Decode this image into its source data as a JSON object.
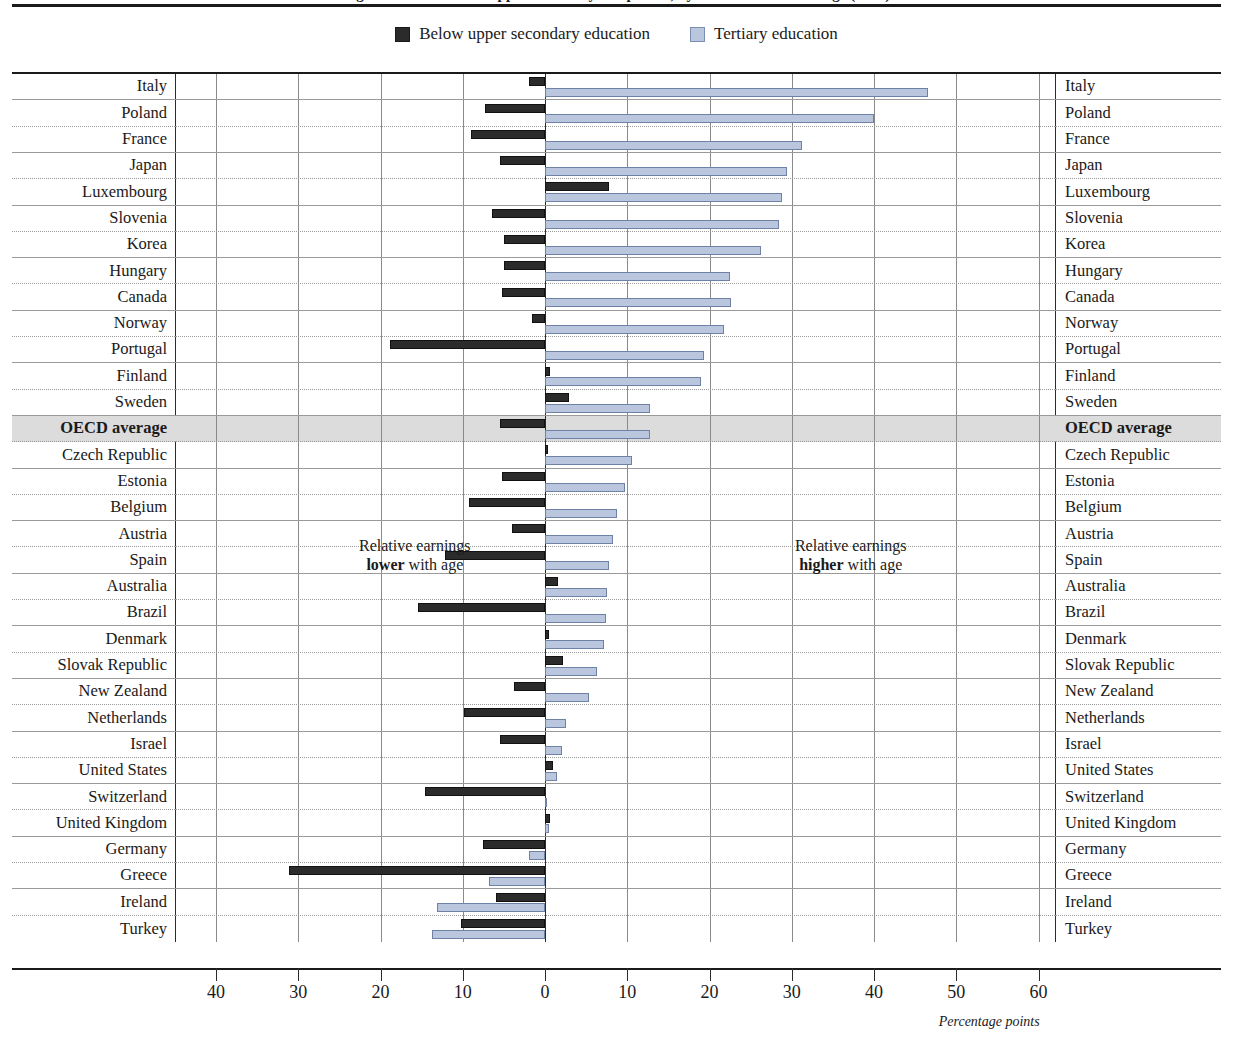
{
  "title": "Figure A6.2. Trends in upper secondary completion, by education level and age (2012)",
  "legend": [
    {
      "label": "Below upper secondary education",
      "swatch": "dark-square-icon",
      "color": "#2b2b2b"
    },
    {
      "label": "Tertiary education",
      "swatch": "blue-square-icon",
      "color": "#b9c6de"
    }
  ],
  "annotations": {
    "left_line1": "Relative earnings",
    "left_bold": "lower",
    "left_rest": " with age",
    "right_line1": "Relative earnings",
    "right_bold": "higher",
    "right_rest": " with age"
  },
  "axis": {
    "unit_label": "Percentage points",
    "tick_labels": [
      "40",
      "30",
      "20",
      "10",
      "0",
      "10",
      "20",
      "30",
      "40",
      "50",
      "60"
    ],
    "tick_values": [
      -40,
      -30,
      -20,
      -10,
      0,
      10,
      20,
      30,
      40,
      50,
      60
    ]
  },
  "chart_data": {
    "type": "bar",
    "orientation": "horizontal",
    "title": "Figure A6.2. Trends in upper secondary completion, by education level and age (2012)",
    "xlabel": "Percentage points",
    "ylabel": "",
    "xlim": [
      -45,
      62
    ],
    "grid": true,
    "legend_position": "top-center",
    "categories": [
      "Italy",
      "Poland",
      "France",
      "Japan",
      "Luxembourg",
      "Slovenia",
      "Korea",
      "Hungary",
      "Canada",
      "Norway",
      "Portugal",
      "Finland",
      "Sweden",
      "OECD average",
      "Czech Republic",
      "Estonia",
      "Belgium",
      "Austria",
      "Spain",
      "Australia",
      "Brazil",
      "Denmark",
      "Slovak Republic",
      "New Zealand",
      "Netherlands",
      "Israel",
      "United States",
      "Switzerland",
      "United Kingdom",
      "Germany",
      "Greece",
      "Ireland",
      "Turkey"
    ],
    "highlight_category": "OECD average",
    "series": [
      {
        "name": "Below upper secondary education",
        "color": "#2b2b2b",
        "values": [
          -2.0,
          -7.3,
          -9.0,
          -5.5,
          7.8,
          -6.4,
          -5.0,
          -5.0,
          -5.3,
          -1.6,
          -18.8,
          0.6,
          2.9,
          -5.5,
          0.3,
          -5.3,
          -9.2,
          -4.0,
          -12.2,
          1.6,
          -15.4,
          0.5,
          2.2,
          -3.8,
          -9.9,
          -5.5,
          1.0,
          -14.6,
          0.6,
          -7.5,
          -31.1,
          -6.0,
          -10.2
        ]
      },
      {
        "name": "Tertiary education",
        "color": "#b9c6de",
        "values": [
          46.6,
          40.0,
          31.2,
          29.4,
          28.8,
          28.5,
          26.2,
          22.5,
          22.6,
          21.7,
          19.3,
          19.0,
          12.8,
          12.7,
          10.6,
          9.7,
          8.8,
          8.3,
          7.8,
          7.5,
          7.4,
          7.2,
          6.3,
          5.4,
          2.5,
          2.1,
          1.4,
          0.2,
          0.5,
          -1.9,
          -6.8,
          -13.2,
          -13.8
        ]
      }
    ]
  }
}
